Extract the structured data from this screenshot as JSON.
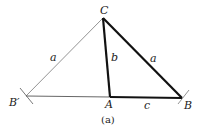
{
  "figure": {
    "caption": "(a)",
    "vertices": {
      "C": {
        "label": "C",
        "x": 103,
        "y": 18
      },
      "B_prime": {
        "label": "B′",
        "x": 26,
        "y": 96
      },
      "A": {
        "label": "A",
        "x": 110,
        "y": 97
      },
      "B": {
        "label": "B",
        "x": 182,
        "y": 98
      }
    },
    "sides": {
      "a_left": "a",
      "b": "b",
      "a_right": "a",
      "c": "c"
    },
    "colors": {
      "thin_line": "#777777",
      "thick_line": "#111111"
    }
  }
}
